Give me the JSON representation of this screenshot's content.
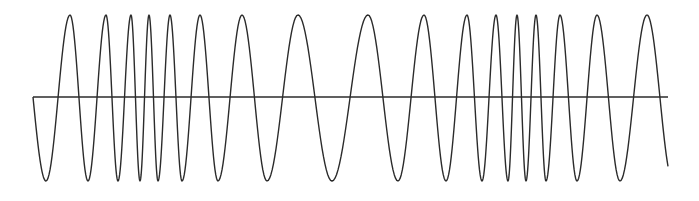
{
  "diagram": {
    "type": "frequency-modulated-waveform",
    "stroke_color": "#2b2b2b",
    "axis": {
      "x_start": 33,
      "x_end": 668,
      "y": 97
    },
    "amplitude": {
      "peak_y": 15,
      "trough_y": 181
    },
    "start": {
      "x": 33,
      "y": 97
    },
    "extrema": [
      {
        "x": 46,
        "type": "trough"
      },
      {
        "x": 70,
        "type": "peak"
      },
      {
        "x": 88,
        "type": "trough"
      },
      {
        "x": 106,
        "type": "peak"
      },
      {
        "x": 118,
        "type": "trough"
      },
      {
        "x": 131,
        "type": "peak"
      },
      {
        "x": 140,
        "type": "trough"
      },
      {
        "x": 149,
        "type": "peak"
      },
      {
        "x": 158,
        "type": "trough"
      },
      {
        "x": 170,
        "type": "peak"
      },
      {
        "x": 182,
        "type": "trough"
      },
      {
        "x": 200,
        "type": "peak"
      },
      {
        "x": 218,
        "type": "trough"
      },
      {
        "x": 242,
        "type": "peak"
      },
      {
        "x": 267,
        "type": "trough"
      },
      {
        "x": 298,
        "type": "peak"
      },
      {
        "x": 332,
        "type": "trough"
      },
      {
        "x": 368,
        "type": "peak"
      },
      {
        "x": 398,
        "type": "trough"
      },
      {
        "x": 424,
        "type": "peak"
      },
      {
        "x": 446,
        "type": "trough"
      },
      {
        "x": 467,
        "type": "peak"
      },
      {
        "x": 482,
        "type": "trough"
      },
      {
        "x": 496,
        "type": "peak"
      },
      {
        "x": 508,
        "type": "trough"
      },
      {
        "x": 517,
        "type": "peak"
      },
      {
        "x": 526,
        "type": "trough"
      },
      {
        "x": 536,
        "type": "peak"
      },
      {
        "x": 546,
        "type": "trough"
      },
      {
        "x": 560,
        "type": "peak"
      },
      {
        "x": 577,
        "type": "trough"
      },
      {
        "x": 597,
        "type": "peak"
      },
      {
        "x": 620,
        "type": "trough"
      },
      {
        "x": 647,
        "type": "peak"
      }
    ],
    "end": {
      "x": 668,
      "y": 153
    }
  }
}
